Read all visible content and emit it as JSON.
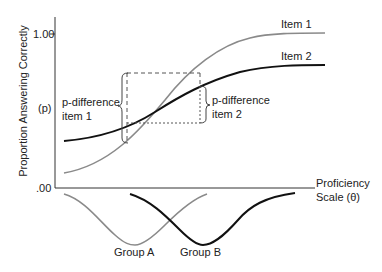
{
  "diagram": {
    "y_axis_label": "Proportion Answering Correctly",
    "y_axis_symbol": "(p)",
    "y_tick_top": "1.00",
    "y_tick_bottom": ".00",
    "x_axis_label_line1": "Proficiency",
    "x_axis_label_line2": "Scale (θ)",
    "curves": [
      {
        "name": "Item 1",
        "color": "#8a8a8a"
      },
      {
        "name": "Item 2",
        "color": "#111111"
      }
    ],
    "annotations": {
      "pdiff1_line1": "p-difference",
      "pdiff1_line2": "item 1",
      "pdiff2_line1": "p-difference",
      "pdiff2_line2": "item 2"
    },
    "groups": [
      {
        "name": "Group A",
        "color": "#8a8a8a"
      },
      {
        "name": "Group B",
        "color": "#111111"
      }
    ]
  }
}
